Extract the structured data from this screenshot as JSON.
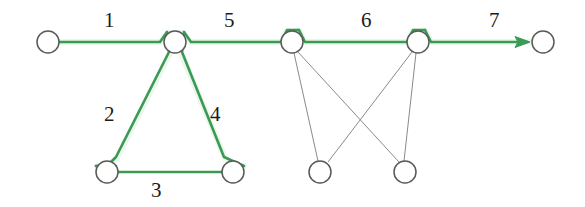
{
  "diagram": {
    "colors": {
      "flow_path": "#3a9a54",
      "flow_path_highlight": "#eaf7ec",
      "node_stroke": "#5a5a5a",
      "node_fill": "#ffffff",
      "secondary_link": "#8a8a8a",
      "label_text": "#1c1c1c",
      "background": "#ffffff"
    },
    "edge_labels": [
      {
        "id": "label-1",
        "text": "1",
        "x": 104,
        "y": 10
      },
      {
        "id": "label-2",
        "text": "2",
        "x": 104,
        "y": 104
      },
      {
        "id": "label-3",
        "text": "3",
        "x": 151,
        "y": 180
      },
      {
        "id": "label-4",
        "text": "4",
        "x": 210,
        "y": 104
      },
      {
        "id": "label-5",
        "text": "5",
        "x": 224,
        "y": 10
      },
      {
        "id": "label-6",
        "text": "6",
        "x": 361,
        "y": 10
      },
      {
        "id": "label-7",
        "text": "7",
        "x": 489,
        "y": 10
      }
    ],
    "nodes": [
      {
        "id": "node-source-left",
        "label": "source-left-node",
        "cx": 48,
        "cy": 42,
        "r": 11
      },
      {
        "id": "node-hub-center",
        "label": "center-hub-node",
        "cx": 175,
        "cy": 42,
        "r": 11
      },
      {
        "id": "node-bottom-left",
        "label": "bottom-left-node",
        "cx": 107,
        "cy": 172,
        "r": 11
      },
      {
        "id": "node-bottom-right",
        "label": "bottom-right-node",
        "cx": 233,
        "cy": 172,
        "r": 11
      },
      {
        "id": "node-mid-upper-a",
        "label": "upper-junction-a",
        "cx": 292,
        "cy": 42,
        "r": 11
      },
      {
        "id": "node-mid-upper-b",
        "label": "upper-junction-b",
        "cx": 418,
        "cy": 42,
        "r": 11
      },
      {
        "id": "node-mid-lower-a",
        "label": "lower-junction-a",
        "cx": 320,
        "cy": 172,
        "r": 11
      },
      {
        "id": "node-mid-lower-b",
        "label": "lower-junction-b",
        "cx": 405,
        "cy": 172,
        "r": 11
      },
      {
        "id": "node-sink-right",
        "label": "sink-right-node",
        "cx": 543,
        "cy": 42,
        "r": 11
      }
    ],
    "flow_segments": [
      {
        "id": "segment-1",
        "label": "edge-1-source-to-hub",
        "from": "node-source-left",
        "to": "node-hub-center"
      },
      {
        "id": "segment-2",
        "label": "edge-2-hub-to-bottomleft",
        "from": "node-hub-center",
        "to": "node-bottom-left"
      },
      {
        "id": "segment-3",
        "label": "edge-3-bottom-base",
        "from": "node-bottom-left",
        "to": "node-bottom-right"
      },
      {
        "id": "segment-4",
        "label": "edge-4-bottomright-to-hub",
        "from": "node-bottom-right",
        "to": "node-hub-center"
      },
      {
        "id": "segment-5",
        "label": "edge-5-hub-to-junction-a",
        "from": "node-hub-center",
        "to": "node-mid-upper-a"
      },
      {
        "id": "segment-6",
        "label": "edge-6-junction-a-to-b",
        "from": "node-mid-upper-a",
        "to": "node-mid-upper-b"
      },
      {
        "id": "segment-7",
        "label": "edge-7-junction-b-to-sink",
        "from": "node-mid-upper-b",
        "to": "node-sink-right"
      }
    ],
    "secondary_links": [
      {
        "id": "link-a-down",
        "label": "link-upper-a-to-lower-a",
        "from": "node-mid-upper-a",
        "to": "node-mid-lower-a"
      },
      {
        "id": "link-a-cross",
        "label": "link-upper-a-to-lower-b",
        "from": "node-mid-upper-a",
        "to": "node-mid-lower-b"
      },
      {
        "id": "link-b-cross",
        "label": "link-upper-b-to-lower-a",
        "from": "node-mid-upper-b",
        "to": "node-mid-lower-a"
      },
      {
        "id": "link-b-down",
        "label": "link-upper-b-to-lower-b",
        "from": "node-mid-upper-b",
        "to": "node-mid-lower-b"
      }
    ],
    "arrow": {
      "id": "flow-arrowhead",
      "label": "flow-direction-arrowhead",
      "x": 528,
      "y": 42
    }
  }
}
